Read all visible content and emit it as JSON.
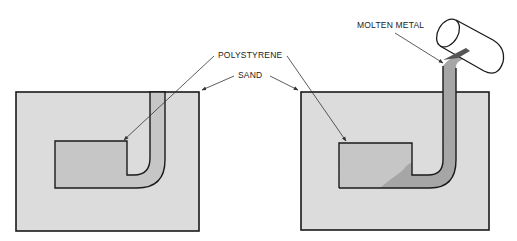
{
  "labels": {
    "polystyrene": "POLYSTYRENE",
    "sand": "SAND",
    "molten_metal": "MOLTEN METAL"
  },
  "colors": {
    "background": "#ffffff",
    "sand": "#dcdcdc",
    "polystyrene": "#c6c6c6",
    "metal": "#a6a6a6",
    "outline": "#1a1a1a",
    "leader": "#333333"
  },
  "panels": [
    {
      "name": "before-pouring",
      "description": "Polystyrene pattern embedded in sand"
    },
    {
      "name": "during-pouring",
      "description": "Molten metal poured, replacing polystyrene"
    }
  ]
}
